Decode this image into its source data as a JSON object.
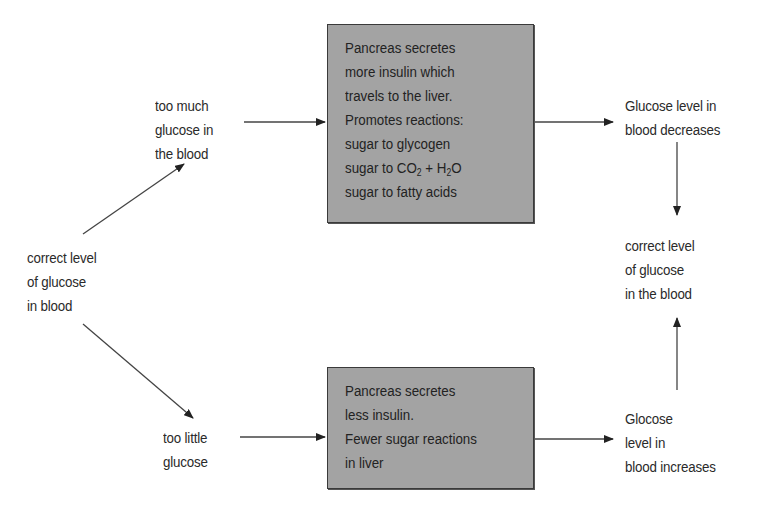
{
  "diagram": {
    "nodes": {
      "start": {
        "lines": [
          "correct level",
          "of glucose",
          "in blood"
        ]
      },
      "too_much": {
        "lines": [
          "too much",
          "glucose in",
          "the blood"
        ]
      },
      "too_little": {
        "lines": [
          "too little",
          "glucose"
        ]
      },
      "box_more_insulin": {
        "lines": [
          "Pancreas secretes",
          "more insulin which",
          "travels to the liver.",
          "Promotes reactions:",
          "sugar to glycogen"
        ],
        "reaction_co2": {
          "prefix": "sugar to CO",
          "sub1": "2",
          "middle": " + H",
          "sub2": "2",
          "suffix": "O"
        },
        "last_line": "sugar to fatty acids"
      },
      "box_less_insulin": {
        "lines": [
          "Pancreas secretes",
          "less insulin.",
          "Fewer sugar reactions",
          "in liver"
        ]
      },
      "decreases": {
        "lines": [
          "Glucose level in",
          "blood decreases"
        ]
      },
      "increases": {
        "lines": [
          "Glocose",
          "level in",
          "blood increases"
        ]
      },
      "end": {
        "lines": [
          "correct level",
          "of glucose",
          "in the blood"
        ]
      }
    },
    "edges": [
      {
        "from": "start",
        "to": "too_much"
      },
      {
        "from": "start",
        "to": "too_little"
      },
      {
        "from": "too_much",
        "to": "box_more_insulin"
      },
      {
        "from": "too_little",
        "to": "box_less_insulin"
      },
      {
        "from": "box_more_insulin",
        "to": "decreases"
      },
      {
        "from": "box_less_insulin",
        "to": "increases"
      },
      {
        "from": "decreases",
        "to": "end"
      },
      {
        "from": "increases",
        "to": "end"
      }
    ],
    "colors": {
      "box_fill": "#a3a3a3",
      "box_border": "#3a3a3a",
      "arrow": "#333333",
      "text": "#2a2a2a"
    }
  }
}
